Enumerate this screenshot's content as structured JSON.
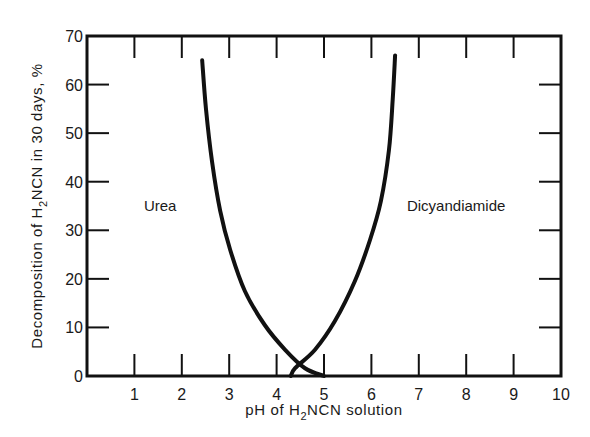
{
  "chart_data": {
    "type": "line",
    "title": "",
    "xlabel": "pH of H2NCN solution",
    "xlabel_parts": {
      "pre": "pH of H",
      "sub": "2",
      "post": "NCN solution"
    },
    "ylabel": "Decomposition of H2NCN in 30 days, %",
    "ylabel_parts": {
      "pre": "Decomposition of H",
      "sub": "2",
      "post": "NCN in 30 days, %"
    },
    "xlim": [
      0,
      10
    ],
    "ylim": [
      0,
      70
    ],
    "x_ticks": [
      "1",
      "2",
      "3",
      "4",
      "5",
      "6",
      "7",
      "8",
      "9",
      "10"
    ],
    "y_ticks": [
      "0",
      "10",
      "20",
      "30",
      "40",
      "50",
      "60",
      "70"
    ],
    "grid": false,
    "legend": "inline labels",
    "series": [
      {
        "name": "Urea",
        "label_position": {
          "x": 1.2,
          "y": 35
        },
        "points": [
          {
            "x": 2.43,
            "y": 65
          },
          {
            "x": 2.51,
            "y": 55
          },
          {
            "x": 2.64,
            "y": 44
          },
          {
            "x": 2.81,
            "y": 34
          },
          {
            "x": 3.02,
            "y": 26
          },
          {
            "x": 3.33,
            "y": 17.5
          },
          {
            "x": 3.75,
            "y": 10.5
          },
          {
            "x": 4.18,
            "y": 5.4
          },
          {
            "x": 4.6,
            "y": 1.6
          },
          {
            "x": 5.0,
            "y": 0
          }
        ]
      },
      {
        "name": "Dicyandiamide",
        "label_position": {
          "x": 6.75,
          "y": 35
        },
        "points": [
          {
            "x": 6.5,
            "y": 66
          },
          {
            "x": 6.45,
            "y": 57
          },
          {
            "x": 6.37,
            "y": 46.5
          },
          {
            "x": 6.2,
            "y": 36
          },
          {
            "x": 5.97,
            "y": 28
          },
          {
            "x": 5.65,
            "y": 19.5
          },
          {
            "x": 5.23,
            "y": 11.3
          },
          {
            "x": 4.81,
            "y": 5.4
          },
          {
            "x": 4.39,
            "y": 1.6
          },
          {
            "x": 4.3,
            "y": 0
          }
        ]
      }
    ]
  }
}
